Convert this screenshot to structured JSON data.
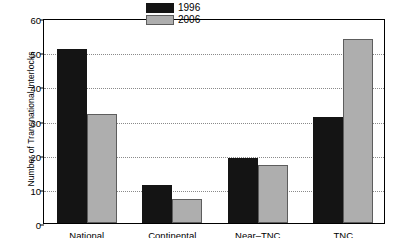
{
  "chart_data": {
    "type": "bar",
    "title": "",
    "xlabel": "",
    "ylabel": "Number of Transnational Interlocks",
    "ylim": [
      0,
      60
    ],
    "yticks": [
      0,
      10,
      20,
      30,
      40,
      50,
      60
    ],
    "ytick_labels": [
      "0",
      "10",
      "20",
      "30",
      "40",
      "50",
      "60"
    ],
    "grid": "horizontal-dotted",
    "legend_position": "top-center-right",
    "categories": [
      "National",
      "Continental",
      "Near–TNC",
      "TNC"
    ],
    "series": [
      {
        "name": "1996",
        "color": "#141414",
        "values": [
          51,
          11,
          19,
          31
        ]
      },
      {
        "name": "2006",
        "color": "#aeaeae",
        "values": [
          32,
          7,
          17,
          54
        ]
      }
    ]
  },
  "legend": {
    "entries": [
      {
        "label": "1996"
      },
      {
        "label": "2006"
      }
    ]
  }
}
